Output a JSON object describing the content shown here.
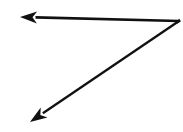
{
  "figure": {
    "background_color": "#ffffff",
    "stroke_color": "#111111",
    "width": 183,
    "height": 132,
    "corner_mark_text": "5.",
    "vertex": {
      "label": "vertex",
      "x": 179,
      "y": 21
    },
    "rays": [
      {
        "name": "horizontal-ray",
        "direction": "left",
        "from_x": 179,
        "from_y": 21,
        "to_x": 22,
        "to_y": 17,
        "stroke_width": 2.6,
        "arrowhead": "triangle",
        "arrow_tip_x": 20,
        "arrow_tip_y": 17
      },
      {
        "name": "diagonal-ray",
        "direction": "down-left",
        "from_x": 179,
        "from_y": 21,
        "to_x": 34,
        "to_y": 118,
        "stroke_width": 2.3,
        "arrowhead": "triangle",
        "arrow_tip_x": 30,
        "arrow_tip_y": 122
      }
    ]
  },
  "chart_data": {
    "type": "diagram",
    "shape": "angle",
    "vertex": [
      179,
      21
    ],
    "ray_endpoints": [
      [
        20,
        17
      ],
      [
        30,
        122
      ]
    ],
    "ray_count": 2,
    "arrowheads": 2,
    "approx_angle_degrees": 32,
    "xlabel": "",
    "ylabel": ""
  }
}
